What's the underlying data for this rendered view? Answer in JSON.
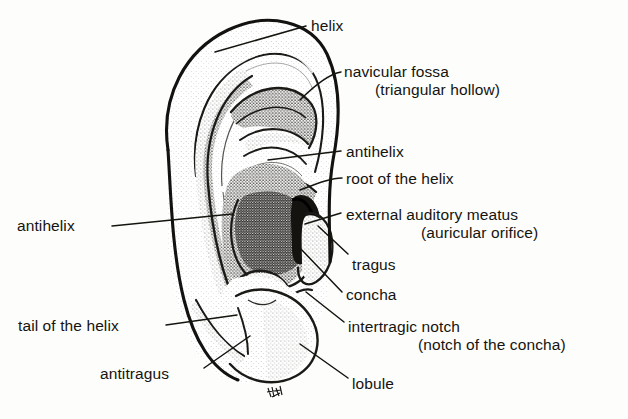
{
  "figure": {
    "ink_color": "#15140f",
    "paper_color": "#fdfdfc",
    "stipple_color": "#6b6a64"
  },
  "labels": {
    "helix": "helix",
    "navicular_fossa": "navicular fossa",
    "navicular_fossa_alt": "(triangular hollow)",
    "antihelix_right": "antihelix",
    "root_of_the_helix": "root of the helix",
    "external_auditory_meatus": "external auditory meatus",
    "external_auditory_meatus_alt": "(auricular orifice)",
    "tragus": "tragus",
    "concha": "concha",
    "intertragic_notch": "intertragic notch",
    "intertragic_notch_alt": "(notch of the concha)",
    "lobule": "lobule",
    "antihelix_left": "antihelix",
    "tail_of_the_helix": "tail of the helix",
    "antitragus": "antitragus"
  }
}
